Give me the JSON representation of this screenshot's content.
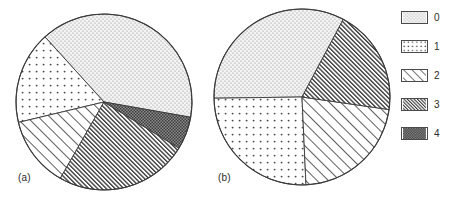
{
  "figure": {
    "background_color": "#ffffff",
    "line_color": "#3a3a3a",
    "text_color": "#2b2b2b",
    "panels": [
      {
        "id": "a",
        "label": "(a)"
      },
      {
        "id": "b",
        "label": "(b)"
      }
    ]
  },
  "legend": {
    "position": "right",
    "entries": [
      {
        "label": "0",
        "pattern": "fine-dots",
        "fill": "#f2f2f2",
        "mark": "#9a9a9a"
      },
      {
        "label": "1",
        "pattern": "sparse-dots",
        "fill": "#ffffff",
        "mark": "#555555"
      },
      {
        "label": "2",
        "pattern": "light-hatch",
        "fill": "#ffffff",
        "mark": "#555555"
      },
      {
        "label": "3",
        "pattern": "dense-hatch",
        "fill": "#ffffff",
        "mark": "#3a3a3a"
      },
      {
        "label": "4",
        "pattern": "dark-check",
        "fill": "#7b7b7b",
        "mark": "#2a2a2a"
      }
    ]
  },
  "chart_data": [
    {
      "type": "pie",
      "title": "(a)",
      "xlabel": "",
      "ylabel": "",
      "categories": [
        "0",
        "1",
        "2",
        "3",
        "4"
      ],
      "values": [
        39.5,
        17.0,
        13.0,
        24.5,
        6.0
      ],
      "units": "percent",
      "start_angle_deg": 350,
      "direction": "counterclockwise",
      "center": {
        "x": 104,
        "y": 102
      },
      "radius": 88,
      "legend_position": "right",
      "grid": false
    },
    {
      "type": "pie",
      "title": "(b)",
      "xlabel": "",
      "ylabel": "",
      "categories": [
        "0",
        "1",
        "2",
        "3",
        "4"
      ],
      "values": [
        33.0,
        25.5,
        22.0,
        19.5,
        0.0
      ],
      "units": "percent",
      "start_angle_deg": 62,
      "direction": "counterclockwise",
      "center": {
        "x": 302,
        "y": 97
      },
      "radius": 88,
      "legend_position": "right",
      "grid": false
    }
  ]
}
